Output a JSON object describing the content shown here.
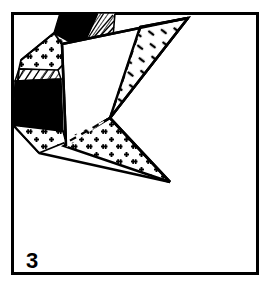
{
  "figure": {
    "label": "3",
    "label_position": {
      "x": 26,
      "y": 268
    },
    "caption": "",
    "background_color": "#ffffff",
    "ink_color": "#000000",
    "frame": {
      "x": 11,
      "y": 12,
      "width": 245,
      "height": 260,
      "stroke_width": 3,
      "stroke_color": "#000000",
      "fill": "#ffffff"
    },
    "patterns": [
      {
        "name": "plus-stipple",
        "description": "scattered plus signs (granite / igneous stipple)",
        "color": "#000000"
      },
      {
        "name": "solid-black",
        "description": "solid black fill",
        "color": "#000000"
      },
      {
        "name": "diagonal-hatch",
        "description": "fine diagonal line hatching",
        "color": "#000000"
      },
      {
        "name": "sparse-dash",
        "description": "sparse short dashes / dots",
        "color": "#000000"
      },
      {
        "name": "blank-white",
        "description": "unfilled white facet",
        "color": "#ffffff"
      }
    ],
    "facets": [
      {
        "id": "facet-black-top",
        "fill_pattern": "solid-black",
        "points": "63,14 97,14 93,40 80,46 56,33"
      },
      {
        "id": "facet-hatch-top",
        "fill_pattern": "diagonal-hatch",
        "points": "97,14 113,14 112,36 84,45"
      },
      {
        "id": "facet-plus-upperleft",
        "fill_pattern": "plus-stipple",
        "points": "56,33 80,46 58,70 20,68 22,62"
      },
      {
        "id": "facet-hatch-left",
        "fill_pattern": "diagonal-hatch",
        "points": "20,68 58,70 60,78 16,80"
      },
      {
        "id": "facet-black-left",
        "fill_pattern": "solid-black",
        "points": "16,80 60,78 62,130 14,124"
      },
      {
        "id": "facet-plus-lowerleft",
        "fill_pattern": "plus-stipple",
        "points": "14,124 62,130 64,140 40,152"
      },
      {
        "id": "facet-white-center",
        "fill_pattern": "blank-white",
        "points": "63,44 188,18 110,118 64,140"
      },
      {
        "id": "facet-dash-right-wing",
        "fill_pattern": "sparse-dash",
        "points": "188,18 141,27 110,118"
      },
      {
        "id": "facet-plus-bottom",
        "fill_pattern": "plus-stipple",
        "points": "110,118 170,182 66,145"
      },
      {
        "id": "facet-dash-lower-left-wedge",
        "fill_pattern": "sparse-dash",
        "points": "110,118 66,145 64,140"
      }
    ],
    "edges": [
      {
        "id": "edge-top-ridge",
        "from": [
          63,
          44
        ],
        "to": [
          188,
          18
        ],
        "style": "solid"
      },
      {
        "id": "edge-right-upper",
        "from": [
          188,
          18
        ],
        "to": [
          110,
          118
        ],
        "style": "solid"
      },
      {
        "id": "edge-fold-dashed",
        "from": [
          141,
          27
        ],
        "to": [
          110,
          118
        ],
        "style": "dashed"
      },
      {
        "id": "edge-lower-right",
        "from": [
          110,
          118
        ],
        "to": [
          170,
          182
        ],
        "style": "solid"
      },
      {
        "id": "edge-lower-left",
        "from": [
          170,
          182
        ],
        "to": [
          40,
          152
        ],
        "style": "solid"
      },
      {
        "id": "edge-center-vertical",
        "from": [
          63,
          44
        ],
        "to": [
          66,
          145
        ],
        "style": "solid"
      },
      {
        "id": "edge-diagonal-fold",
        "from": [
          110,
          118
        ],
        "to": [
          64,
          144
        ],
        "style": "dashed"
      }
    ]
  }
}
